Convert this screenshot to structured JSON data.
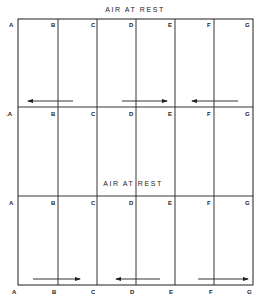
{
  "diagram": {
    "titles": [
      {
        "text": "AIR  AT  REST",
        "x": 135,
        "y": 6
      },
      {
        "text": "AIR  AT  REST",
        "x": 133,
        "y": 180
      }
    ],
    "frame": {
      "left": 18,
      "right": 253,
      "top": 19,
      "bottom": 285
    },
    "vertical_lines_x": [
      58,
      97,
      136,
      175,
      214
    ],
    "horizontal_lines_y": [
      107,
      196
    ],
    "row_labels": [
      {
        "row": 1,
        "y": 21,
        "labels": [
          "A",
          "B",
          "C",
          "D",
          "E",
          "F",
          "G"
        ]
      },
      {
        "row": 2,
        "y": 109,
        "labels": [
          ".A",
          "B",
          "C",
          "D",
          "E",
          "F",
          "G"
        ]
      },
      {
        "row": 3,
        "y": 198,
        "labels": [
          "A",
          "B",
          "C",
          "D",
          "E",
          "F",
          "G"
        ]
      },
      {
        "row": 4,
        "y": 289,
        "labels": [
          "A",
          "B",
          "C",
          "D",
          "E",
          "F",
          "G"
        ]
      }
    ],
    "arrows": [
      {
        "band": "upper",
        "x1": 73,
        "x2": 28,
        "y": 101,
        "direction": "left"
      },
      {
        "band": "upper",
        "x1": 122,
        "x2": 167,
        "y": 101,
        "direction": "right"
      },
      {
        "band": "upper",
        "x1": 238,
        "x2": 192,
        "y": 101,
        "direction": "left"
      },
      {
        "band": "lower",
        "x1": 33,
        "x2": 80,
        "y": 279,
        "direction": "right"
      },
      {
        "band": "lower",
        "x1": 160,
        "x2": 116,
        "y": 279,
        "direction": "left"
      },
      {
        "band": "lower",
        "x1": 198,
        "x2": 248,
        "y": 279,
        "direction": "right"
      }
    ],
    "colors": {
      "line": "#1f1f1f",
      "background": "#ffffff"
    }
  }
}
